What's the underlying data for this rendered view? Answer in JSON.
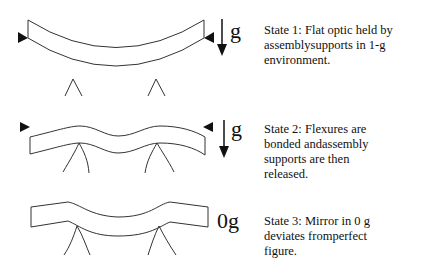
{
  "states": [
    {
      "id": "state1",
      "gravity_label": "g",
      "caption": "State 1: Flat optic held by\nassemblysupports in 1-g\nenvironment."
    },
    {
      "id": "state2",
      "gravity_label": "g",
      "caption": "State 2: Flexures are\nbonded andassembly\nsupports are then\nreleased."
    },
    {
      "id": "state3",
      "gravity_label": "0g",
      "caption": "State 3: Mirror in 0 g\ndeviates fromperfect\nfigure."
    }
  ],
  "colors": {
    "stroke": "#333333",
    "background": "#ffffff"
  }
}
